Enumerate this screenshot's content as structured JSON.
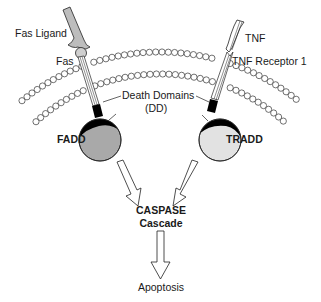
{
  "diagram": {
    "labels": {
      "fas_ligand": "Fas Ligand",
      "fas": "Fas",
      "tnf": "TNF",
      "tnf_receptor": "TNF Receptor 1",
      "death_domains": "Death Domains",
      "dd_abbrev": "(DD)",
      "fadd": "FADD",
      "tradd": "TRADD",
      "caspase": "CASPASE",
      "cascade": "Cascade",
      "apoptosis": "Apoptosis"
    },
    "colors": {
      "fadd_fill": "#a9a9a9",
      "tradd_fill": "#e2e2e2",
      "death_domain": "#000000",
      "ligand_fill": "#bdbdbd",
      "stroke": "#222222"
    },
    "nodes": [
      {
        "id": "fas-ligand",
        "type": "ligand"
      },
      {
        "id": "fas",
        "type": "receptor"
      },
      {
        "id": "tnf",
        "type": "ligand"
      },
      {
        "id": "tnf-receptor-1",
        "type": "receptor"
      },
      {
        "id": "fadd",
        "type": "adaptor"
      },
      {
        "id": "tradd",
        "type": "adaptor"
      },
      {
        "id": "caspase-cascade",
        "type": "process"
      },
      {
        "id": "apoptosis",
        "type": "outcome"
      }
    ],
    "edges": [
      {
        "from": "fas-ligand",
        "to": "fas"
      },
      {
        "from": "tnf",
        "to": "tnf-receptor-1"
      },
      {
        "from": "fas",
        "to": "fadd"
      },
      {
        "from": "tnf-receptor-1",
        "to": "tradd"
      },
      {
        "from": "fadd",
        "to": "caspase-cascade"
      },
      {
        "from": "tradd",
        "to": "caspase-cascade"
      },
      {
        "from": "caspase-cascade",
        "to": "apoptosis"
      }
    ]
  }
}
